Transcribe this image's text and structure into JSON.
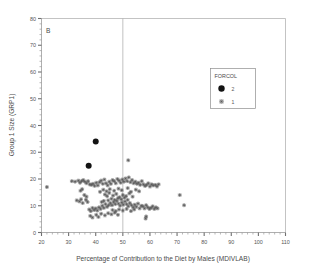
{
  "figure": {
    "panel_label": "B",
    "background_color": "#ffffff",
    "axis_color": "#9a9a9a",
    "marker_color_group1": "#595959",
    "marker_color_group2": "#131313"
  },
  "legend": {
    "title": "FORCOL",
    "entries": [
      {
        "label": "2",
        "marker": "filled-circle-icon"
      },
      {
        "label": "1",
        "marker": "asterisk-icon"
      }
    ]
  },
  "chart_data": {
    "type": "scatter",
    "title": "B",
    "xlabel": "Percentage of Contribution to the Diet by Males (MDIVLAB)",
    "ylabel": "Group 1 Size (GRP1)",
    "xlim": [
      20,
      110
    ],
    "ylim": [
      0,
      80
    ],
    "xticks": [
      20,
      30,
      40,
      50,
      60,
      70,
      80,
      90,
      100,
      110
    ],
    "yticks": [
      0,
      10,
      20,
      30,
      40,
      50,
      60,
      70,
      80
    ],
    "x_minor_tick_step": 2,
    "y_minor_tick_step": 2,
    "grid": false,
    "legend_position": "upper-right-inside",
    "reference_lines": [
      {
        "orientation": "vertical",
        "value": 50
      }
    ],
    "series": [
      {
        "name": "2",
        "marker": "filled-circle",
        "color": "#131313",
        "size": 6,
        "points": [
          [
            40.0,
            34.0
          ],
          [
            37.4,
            25.0
          ]
        ]
      },
      {
        "name": "1",
        "marker": "asterisk",
        "color": "#595959",
        "size": 4,
        "points": [
          [
            22.0,
            17.0
          ],
          [
            31.2,
            19.2
          ],
          [
            32.4,
            19.0
          ],
          [
            33.6,
            19.4
          ],
          [
            34.2,
            18.6
          ],
          [
            34.8,
            19.2
          ],
          [
            35.4,
            19.6
          ],
          [
            33.0,
            12.0
          ],
          [
            34.0,
            11.6
          ],
          [
            34.6,
            12.4
          ],
          [
            35.2,
            11.0
          ],
          [
            36.0,
            19.0
          ],
          [
            36.6,
            18.4
          ],
          [
            37.2,
            19.2
          ],
          [
            37.8,
            18.0
          ],
          [
            36.4,
            12.2
          ],
          [
            37.0,
            11.4
          ],
          [
            37.6,
            8.6
          ],
          [
            38.2,
            8.0
          ],
          [
            38.8,
            9.2
          ],
          [
            39.4,
            8.4
          ],
          [
            38.4,
            17.8
          ],
          [
            39.0,
            18.2
          ],
          [
            39.6,
            17.4
          ],
          [
            40.2,
            18.6
          ],
          [
            40.0,
            9.0
          ],
          [
            40.6,
            8.2
          ],
          [
            41.2,
            9.4
          ],
          [
            41.8,
            8.8
          ],
          [
            40.8,
            17.6
          ],
          [
            41.4,
            18.8
          ],
          [
            42.0,
            19.4
          ],
          [
            42.6,
            18.2
          ],
          [
            43.2,
            19.8
          ],
          [
            42.4,
            10.0
          ],
          [
            43.0,
            9.2
          ],
          [
            43.6,
            10.6
          ],
          [
            44.2,
            9.6
          ],
          [
            44.8,
            10.2
          ],
          [
            43.8,
            18.4
          ],
          [
            44.4,
            17.6
          ],
          [
            45.0,
            19.0
          ],
          [
            45.6,
            18.2
          ],
          [
            46.2,
            19.6
          ],
          [
            45.4,
            11.0
          ],
          [
            46.0,
            10.2
          ],
          [
            46.6,
            11.4
          ],
          [
            47.2,
            10.6
          ],
          [
            47.8,
            11.8
          ],
          [
            46.8,
            19.2
          ],
          [
            47.4,
            18.4
          ],
          [
            48.0,
            20.0
          ],
          [
            48.6,
            19.4
          ],
          [
            49.2,
            18.6
          ],
          [
            48.4,
            10.8
          ],
          [
            49.0,
            10.0
          ],
          [
            49.6,
            11.2
          ],
          [
            50.2,
            10.4
          ],
          [
            50.8,
            11.6
          ],
          [
            49.8,
            19.8
          ],
          [
            50.4,
            19.0
          ],
          [
            51.0,
            20.2
          ],
          [
            51.6,
            19.2
          ],
          [
            52.2,
            20.6
          ],
          [
            51.4,
            10.6
          ],
          [
            52.0,
            9.8
          ],
          [
            52.6,
            11.0
          ],
          [
            53.2,
            10.2
          ],
          [
            53.8,
            9.4
          ],
          [
            52.8,
            18.8
          ],
          [
            53.4,
            19.6
          ],
          [
            54.0,
            18.4
          ],
          [
            54.6,
            19.0
          ],
          [
            55.2,
            18.2
          ],
          [
            54.4,
            10.4
          ],
          [
            55.0,
            9.6
          ],
          [
            55.6,
            10.8
          ],
          [
            56.2,
            9.0
          ],
          [
            56.8,
            10.0
          ],
          [
            55.8,
            18.6
          ],
          [
            56.4,
            17.8
          ],
          [
            57.0,
            19.2
          ],
          [
            57.6,
            18.0
          ],
          [
            58.2,
            17.4
          ],
          [
            57.4,
            9.8
          ],
          [
            58.0,
            9.0
          ],
          [
            58.6,
            10.2
          ],
          [
            59.2,
            9.4
          ],
          [
            59.8,
            8.8
          ],
          [
            58.8,
            17.8
          ],
          [
            59.4,
            18.4
          ],
          [
            60.0,
            17.2
          ],
          [
            60.6,
            18.0
          ],
          [
            61.2,
            17.6
          ],
          [
            60.4,
            9.2
          ],
          [
            61.0,
            9.8
          ],
          [
            61.6,
            8.8
          ],
          [
            62.2,
            9.4
          ],
          [
            62.8,
            9.0
          ],
          [
            62.0,
            17.8
          ],
          [
            62.6,
            17.2
          ],
          [
            63.2,
            18.0
          ],
          [
            52.0,
            27.0
          ],
          [
            58.6,
            6.0
          ],
          [
            58.4,
            5.2
          ],
          [
            38.0,
            6.2
          ],
          [
            38.8,
            5.6
          ],
          [
            40.2,
            6.6
          ],
          [
            41.0,
            5.8
          ],
          [
            42.0,
            7.0
          ],
          [
            43.4,
            6.4
          ],
          [
            44.6,
            7.2
          ],
          [
            45.8,
            6.8
          ],
          [
            47.0,
            7.4
          ],
          [
            48.2,
            6.6
          ],
          [
            35.8,
            14.0
          ],
          [
            36.6,
            13.4
          ],
          [
            43.4,
            14.2
          ],
          [
            44.2,
            13.6
          ],
          [
            45.0,
            14.8
          ],
          [
            46.4,
            13.8
          ],
          [
            47.6,
            14.4
          ],
          [
            48.8,
            13.2
          ],
          [
            50.0,
            14.0
          ],
          [
            51.2,
            13.6
          ],
          [
            52.4,
            14.6
          ],
          [
            53.6,
            13.4
          ],
          [
            41.6,
            15.2
          ],
          [
            42.8,
            16.0
          ],
          [
            44.0,
            15.4
          ],
          [
            45.2,
            16.2
          ],
          [
            46.8,
            15.6
          ],
          [
            48.4,
            16.4
          ],
          [
            49.6,
            15.8
          ],
          [
            51.8,
            16.6
          ],
          [
            53.0,
            15.2
          ],
          [
            54.8,
            16.0
          ],
          [
            56.0,
            15.4
          ],
          [
            71.0,
            14.0
          ],
          [
            72.6,
            10.2
          ],
          [
            34.4,
            15.6
          ],
          [
            35.0,
            16.2
          ],
          [
            44.6,
            12.0
          ],
          [
            45.8,
            12.6
          ],
          [
            47.0,
            12.2
          ],
          [
            48.2,
            12.8
          ],
          [
            49.4,
            12.4
          ],
          [
            50.6,
            13.0
          ],
          [
            51.8,
            12.2
          ],
          [
            42.2,
            11.4
          ],
          [
            43.0,
            11.8
          ],
          [
            46.2,
            8.4
          ],
          [
            47.4,
            8.0
          ],
          [
            48.6,
            8.6
          ],
          [
            50.0,
            8.2
          ],
          [
            51.4,
            8.8
          ],
          [
            53.0,
            8.0
          ],
          [
            54.2,
            8.6
          ]
        ]
      }
    ]
  }
}
